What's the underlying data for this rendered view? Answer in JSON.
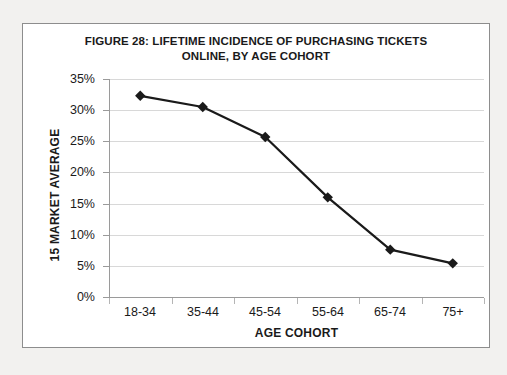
{
  "figure": {
    "title_line1": "FIGURE 28: LIFETIME INCIDENCE OF PURCHASING TICKETS",
    "title_line2": "ONLINE, BY AGE COHORT"
  },
  "colors": {
    "series_line": "#1a1a1a",
    "marker": "#1a1a1a",
    "gridline": "#d8d8d8",
    "axis": "#9a9a9a",
    "frame_border": "#8d8d8d",
    "plot_background": "#ffffff",
    "page_background": "#f2f1ef",
    "text": "#1a1a1a"
  },
  "chart_data": {
    "type": "line",
    "title": "FIGURE 28: LIFETIME INCIDENCE OF PURCHASING TICKETS ONLINE, BY AGE COHORT",
    "xlabel": "AGE COHORT",
    "ylabel": "15 MARKET AVERAGE",
    "categories": [
      "18-34",
      "35-44",
      "45-54",
      "55-64",
      "65-74",
      "75+"
    ],
    "values": [
      32.3,
      30.5,
      25.7,
      16.0,
      7.6,
      5.4
    ],
    "value_unit": "%",
    "ylim": [
      0,
      35
    ],
    "ytick_values": [
      0,
      5,
      10,
      15,
      20,
      25,
      30,
      35
    ],
    "ytick_labels": [
      "0%",
      "5%",
      "10%",
      "15%",
      "20%",
      "25%",
      "30%",
      "35%"
    ],
    "grid": "horizontal",
    "legend": "none",
    "marker": "diamond",
    "series": [
      {
        "name": "15 Market Average",
        "values": [
          32.3,
          30.5,
          25.7,
          16.0,
          7.6,
          5.4
        ]
      }
    ]
  }
}
